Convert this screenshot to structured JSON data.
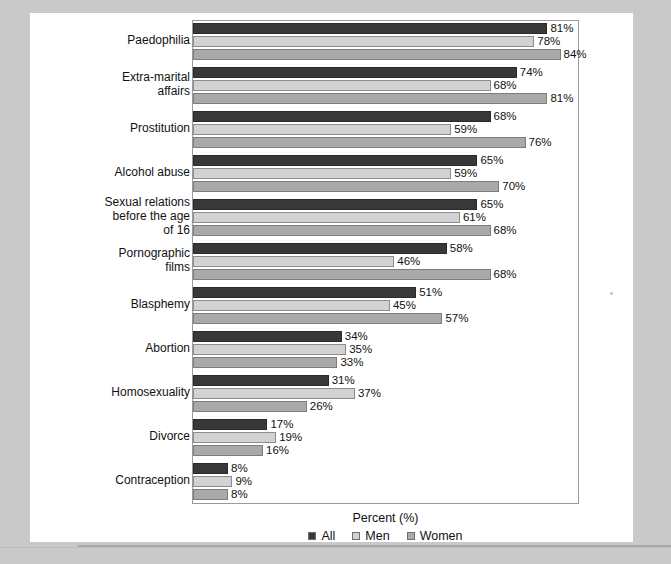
{
  "chart_data": {
    "type": "bar",
    "orientation": "horizontal",
    "title": "",
    "xlabel": "Percent (%)",
    "ylabel": "",
    "xlim": [
      0,
      88
    ],
    "grid": false,
    "legend_position": "bottom",
    "value_suffix": "%",
    "categories": [
      "Paedophilia",
      "Extra-marital affairs",
      "Prostitution",
      "Alcohol abuse",
      "Sexual relations before the age of 16",
      "Pornographic films",
      "Blasphemy",
      "Abortion",
      "Homosexuality",
      "Divorce",
      "Contraception"
    ],
    "category_display": [
      [
        "Paedophilia"
      ],
      [
        "Extra-marital",
        "affairs"
      ],
      [
        "Prostitution"
      ],
      [
        "Alcohol abuse"
      ],
      [
        "Sexual relations",
        "before the age",
        "of 16"
      ],
      [
        "Pornographic",
        "films"
      ],
      [
        "Blasphemy"
      ],
      [
        "Abortion"
      ],
      [
        "Homosexuality"
      ],
      [
        "Divorce"
      ],
      [
        "Contraception"
      ]
    ],
    "series": [
      {
        "name": "All",
        "color": "#383838",
        "values": [
          81,
          74,
          68,
          65,
          65,
          58,
          51,
          34,
          31,
          17,
          8
        ]
      },
      {
        "name": "Men",
        "color": "#d2d2d2",
        "values": [
          78,
          68,
          59,
          59,
          61,
          46,
          45,
          35,
          37,
          19,
          9
        ]
      },
      {
        "name": "Women",
        "color": "#a9a9a9",
        "values": [
          84,
          81,
          76,
          70,
          68,
          68,
          57,
          33,
          26,
          16,
          8
        ]
      }
    ],
    "labels": [
      [
        "81%",
        "78%",
        "84%"
      ],
      [
        "74%",
        "68%",
        "81%"
      ],
      [
        "68%",
        "59%",
        "76%"
      ],
      [
        "65%",
        "59%",
        "70%"
      ],
      [
        "65%",
        "61%",
        "68%"
      ],
      [
        "58%",
        "46%",
        "68%"
      ],
      [
        "51%",
        "45%",
        "57%"
      ],
      [
        "34%",
        "35%",
        "33%"
      ],
      [
        "31%",
        "37%",
        "26%"
      ],
      [
        "17%",
        "19%",
        "16%"
      ],
      [
        "8%",
        "9%",
        "8%"
      ]
    ]
  },
  "legend": {
    "items": [
      {
        "label": "All",
        "color": "#383838"
      },
      {
        "label": "Men",
        "color": "#d2d2d2"
      },
      {
        "label": "Women",
        "color": "#a9a9a9"
      }
    ]
  },
  "axis": {
    "x_title": "Percent (%)"
  },
  "colors": {
    "page_background": "#ffffff",
    "canvas_background": "#c9c9c9",
    "frame_border": "#9a9a9a",
    "text": "#111111"
  }
}
